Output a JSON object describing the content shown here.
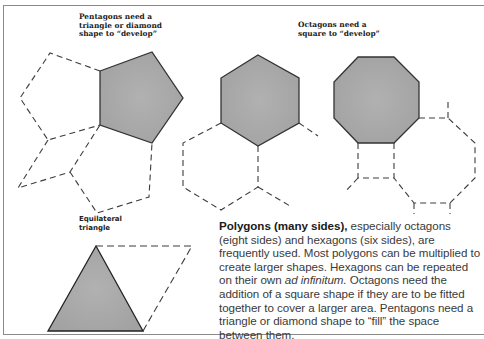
{
  "captions": {
    "pentagons": [
      "Pentagons need a",
      "triangle or diamond",
      "shape to “develop”"
    ],
    "octagons": [
      "Octagons need a",
      "square to “develop”"
    ],
    "triangle": [
      "Equilateral",
      "triangle"
    ]
  },
  "body": {
    "lead_bold": "Polygons (many sides),",
    "text_1": " especially octagons (eight sides) and hexagons (six sides), are frequently used. Most polygons can be multiplied to create larger shapes. Hexagons can be repeated on their own ",
    "italic": "ad infinitum.",
    "text_2": " Octagons need the addition of a square shape if they are to be fitted together to cover a larger area. Pentagons need a triangle or diamond shape to “fill” the space between them."
  },
  "colors": {
    "fill": "#a9a9a9",
    "stroke": "#333333",
    "dash": "#3c3c3c"
  }
}
